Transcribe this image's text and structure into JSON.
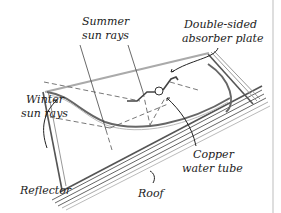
{
  "diagram": {
    "labels": {
      "summer_line1": "Summer",
      "summer_line2": "sun rays",
      "winter_line1": "Winter",
      "winter_line2": "sun rays",
      "absorber_line1": "Double-sided",
      "absorber_line2": "absorber plate",
      "copper_line1": "Copper",
      "copper_line2": "water tube",
      "reflector": "Reflector",
      "roof": "Roof"
    },
    "colors": {
      "ink": "#222222",
      "glass": "#aaaaaa",
      "frame": "#555555",
      "border": "#bdbdbd"
    }
  }
}
